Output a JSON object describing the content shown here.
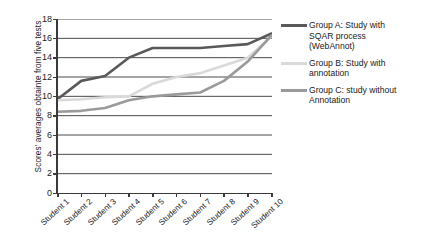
{
  "chart_data": {
    "type": "line",
    "title": "",
    "xlabel": "",
    "ylabel": "Scores' averages  obtainte from five tests",
    "categories": [
      "Student 1",
      "Student 2",
      "Student 3",
      "Student 4",
      "Student 5",
      "Student 6",
      "Student 7",
      "Student 8",
      "Student 9",
      "Student 10"
    ],
    "ylim": [
      0,
      18
    ],
    "ytick_step": 2,
    "yticks": [
      0,
      2,
      4,
      6,
      8,
      10,
      12,
      14,
      16,
      18
    ],
    "grid": "horizontal",
    "legend_position": "right",
    "series": [
      {
        "name": "Group A: Study with\n  SQAR process\n(WebAnnot)",
        "short_name": "Group A",
        "color": "#595959",
        "values": [
          9.7,
          11.6,
          12.1,
          14.0,
          15.0,
          15.0,
          15.0,
          15.2,
          15.4,
          16.5
        ]
      },
      {
        "name": "Group B: Study with\nannotation",
        "short_name": "Group B",
        "color": "#d9d9d9",
        "values": [
          9.6,
          9.7,
          9.9,
          10.0,
          11.3,
          12.0,
          12.4,
          13.2,
          14.0,
          16.2
        ]
      },
      {
        "name": "Group C: study without\nAnnotation",
        "short_name": "Group C",
        "color": "#9a9a9a",
        "values": [
          8.4,
          8.5,
          8.8,
          9.6,
          10.0,
          10.2,
          10.4,
          11.6,
          13.6,
          16.3
        ]
      }
    ]
  },
  "legend": {
    "entries": [
      {
        "label": "Group A: Study with\n  SQAR process\n(WebAnnot)",
        "color": "#595959"
      },
      {
        "label": "Group B: Study with\nannotation",
        "color": "#d9d9d9"
      },
      {
        "label": "Group C: study without\nAnnotation",
        "color": "#9a9a9a"
      }
    ]
  }
}
